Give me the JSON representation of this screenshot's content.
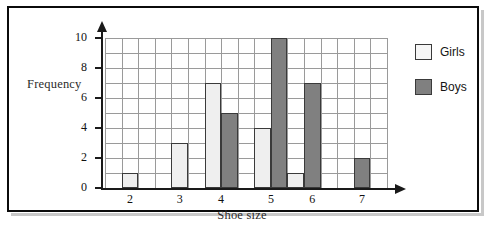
{
  "chart_data": {
    "type": "bar",
    "title": "",
    "xlabel": "Shoe size",
    "ylabel": "Frequency",
    "categories": [
      "2",
      "3",
      "4",
      "5",
      "6",
      "7"
    ],
    "series": [
      {
        "name": "Girls",
        "values": [
          1,
          3,
          7,
          4,
          1,
          0
        ],
        "color": "#efefef"
      },
      {
        "name": "Boys",
        "values": [
          0,
          0,
          5,
          10,
          7,
          2
        ],
        "color": "#808080"
      }
    ],
    "ylim": [
      0,
      10
    ],
    "xlim_categories": 6,
    "y_ticks": [
      "0",
      "2",
      "4",
      "6",
      "8",
      "10"
    ],
    "y_tick_values": [
      0,
      2,
      4,
      6,
      8,
      10
    ],
    "y_gridline_step": 1,
    "grid": true,
    "legend_position": "right",
    "legend_entries": [
      "Girls",
      "Boys"
    ]
  },
  "axes": {
    "y_label": "Frequency",
    "x_label": "Shoe size",
    "y_tick_labels": [
      "0",
      "2",
      "4",
      "6",
      "8",
      "10"
    ],
    "x_tick_labels": [
      "2",
      "3",
      "4",
      "5",
      "6",
      "7"
    ]
  },
  "legend": {
    "items": [
      {
        "label": "Girls",
        "swatch": "girls-swatch-icon"
      },
      {
        "label": "Boys",
        "swatch": "boys-swatch-icon"
      }
    ]
  },
  "colors": {
    "girls_fill": "#efefef",
    "boys_fill": "#808080",
    "bar_stroke": "#3a3a3a",
    "grid": "#9a9a9a",
    "axis": "#1a1a1a",
    "frame": "#0b0b0b",
    "label_text": "#2b2b2b"
  }
}
